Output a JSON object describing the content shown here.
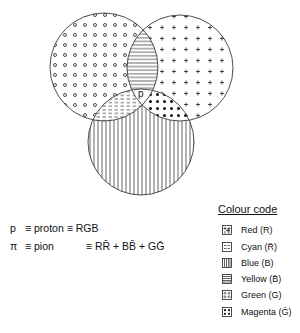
{
  "diagram": {
    "center_label": "p",
    "circles": [
      {
        "name": "left",
        "pattern": "open-circles"
      },
      {
        "name": "right",
        "pattern": "plus"
      },
      {
        "name": "bottom",
        "pattern": "vertical-lines"
      }
    ],
    "intersections": [
      {
        "between": "left-right",
        "pattern": "horizontal-lines"
      },
      {
        "between": "left-bottom",
        "pattern": "dashes"
      },
      {
        "between": "right-bottom",
        "pattern": "filled-dots"
      }
    ]
  },
  "equations": {
    "proton": {
      "symbol": "p",
      "text": "≡ proton ≡ RGB"
    },
    "pion": {
      "symbol": "π",
      "text": "≡ pion",
      "rhs": "≡ RR̄ + BB̄ + GḠ"
    }
  },
  "legend": {
    "title": "Colour code",
    "items": [
      {
        "label": "Red (R)",
        "pattern": "plus"
      },
      {
        "label": "Cyan (R̄)",
        "pattern": "dashes"
      },
      {
        "label": "Blue (B)",
        "pattern": "vertical-lines"
      },
      {
        "label": "Yellow (B̄)",
        "pattern": "horizontal-lines"
      },
      {
        "label": "Green (G)",
        "pattern": "open-circles"
      },
      {
        "label": "Magenta (Ḡ)",
        "pattern": "filled-dots"
      }
    ]
  }
}
